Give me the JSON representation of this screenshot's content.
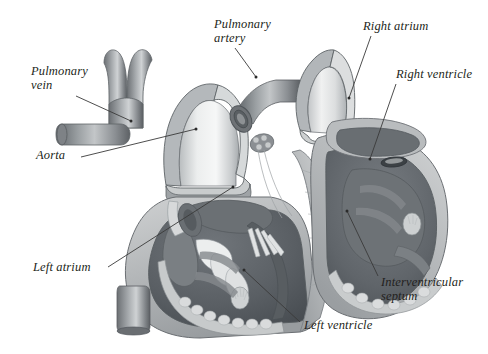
{
  "figure": {
    "background_color": "#ffffff",
    "ink_color": "#231f20",
    "leader_color": "#3a3a3a",
    "width": 488,
    "height": 354
  },
  "palette": {
    "vessel_dark": "#6e7276",
    "vessel_mid": "#8d9195",
    "vessel_light": "#c9ccce",
    "lumen_light": "#e6e8e9",
    "myocardium_light": "#b9bcbd",
    "myocardium_mid": "#9a9ea1",
    "chamber_dark": "#5e6266",
    "chamber_darker": "#4b4f53",
    "endocardium": "#d7d9da",
    "highlight": "#f2f3f3",
    "outline": "#5a5e62"
  },
  "labels": [
    {
      "id": "pulmonary-vein",
      "text": "Pulmonary\nvein",
      "x": 31,
      "y": 64,
      "leader": {
        "x1": 76,
        "y1": 96,
        "x2": 131,
        "y2": 121
      }
    },
    {
      "id": "aorta",
      "text": "Aorta",
      "x": 36,
      "y": 148,
      "leader": {
        "x1": 81,
        "y1": 157,
        "x2": 196,
        "y2": 129
      }
    },
    {
      "id": "left-atrium",
      "text": "Left atrium",
      "x": 33,
      "y": 260,
      "leader": {
        "x1": 108,
        "y1": 267,
        "x2": 233,
        "y2": 187
      }
    },
    {
      "id": "pulmonary-artery",
      "text": "Pulmonary\nartery",
      "x": 214,
      "y": 17,
      "leader": {
        "x1": 235,
        "y1": 48,
        "x2": 256,
        "y2": 77
      }
    },
    {
      "id": "left-ventricle",
      "text": "Left ventricle",
      "x": 304,
      "y": 318,
      "leader": {
        "x1": 300,
        "y1": 322,
        "x2": 244,
        "y2": 270
      }
    },
    {
      "id": "right-atrium",
      "text": "Right atrium",
      "x": 363,
      "y": 19,
      "leader": {
        "x1": 371,
        "y1": 36,
        "x2": 349,
        "y2": 98
      }
    },
    {
      "id": "right-ventricle",
      "text": "Right ventricle",
      "x": 396,
      "y": 67,
      "leader": {
        "x1": 396,
        "y1": 84,
        "x2": 370,
        "y2": 159
      }
    },
    {
      "id": "interventricular-septum",
      "text": "Interventricular\nseptum",
      "x": 381,
      "y": 275,
      "leader": {
        "x1": 378,
        "y1": 276,
        "x2": 347,
        "y2": 211
      }
    }
  ],
  "structures": [
    {
      "id": "aortic-arch",
      "name": "Aorta (cut arch)"
    },
    {
      "id": "pulmonary-vein-stem",
      "name": "Pulmonary vein"
    },
    {
      "id": "pulmonary-artery-cut",
      "name": "Pulmonary artery (cut)"
    },
    {
      "id": "pulmonary-trunk",
      "name": "Pulmonary trunk (cut)"
    },
    {
      "id": "left-atrium-chamber",
      "name": "Left atrium"
    },
    {
      "id": "left-ventricle-chamber",
      "name": "Left ventricle"
    },
    {
      "id": "right-atrium-chamber",
      "name": "Right atrium"
    },
    {
      "id": "right-ventricle-chamber",
      "name": "Right ventricle"
    },
    {
      "id": "iv-septum-wall",
      "name": "Interventricular septum"
    },
    {
      "id": "descending-vessel",
      "name": "Descending vessel stub"
    },
    {
      "id": "chordae-tendineae",
      "name": "Chordae tendineae"
    },
    {
      "id": "papillary-muscle",
      "name": "Papillary muscle"
    }
  ]
}
